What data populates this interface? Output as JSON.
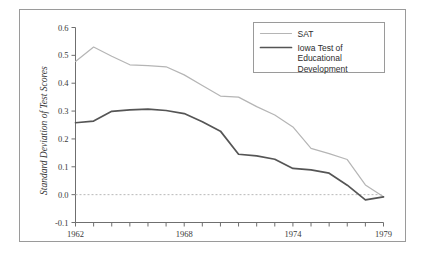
{
  "chart_data": {
    "type": "line",
    "title": "",
    "xlabel": "",
    "ylabel": "Standard Deviation of Test Scores",
    "x": [
      1962,
      1963,
      1964,
      1965,
      1966,
      1967,
      1968,
      1969,
      1970,
      1971,
      1972,
      1973,
      1974,
      1975,
      1976,
      1977,
      1978,
      1979
    ],
    "xlim": [
      1962,
      1979
    ],
    "ylim": [
      -0.1,
      0.6
    ],
    "grid": false,
    "zero_reference_line": 0.0,
    "legend_position": "top-right",
    "xticks": [
      1962,
      1963,
      1964,
      1965,
      1966,
      1967,
      1968,
      1969,
      1970,
      1971,
      1972,
      1973,
      1974,
      1975,
      1976,
      1977,
      1978,
      1979
    ],
    "xtick_labels": [
      "1962",
      "",
      "",
      "",
      "",
      "",
      "1968",
      "",
      "",
      "",
      "",
      "",
      "1974",
      "",
      "",
      "",
      "",
      "1979"
    ],
    "yticks": [
      -0.1,
      0.0,
      0.1,
      0.2,
      0.3,
      0.4,
      0.5,
      0.6
    ],
    "ytick_labels": [
      "-0.1",
      "0.0",
      "0.1",
      "0.2",
      "0.3",
      "0.4",
      "0.5",
      "0.6"
    ],
    "series": [
      {
        "name": "SAT",
        "color": "#b5b5b5",
        "width": 1.2,
        "values": [
          0.478,
          0.53,
          0.497,
          0.466,
          0.463,
          0.459,
          0.43,
          0.392,
          0.354,
          0.35,
          0.316,
          0.286,
          0.243,
          0.166,
          0.147,
          0.126,
          0.035,
          -0.008
        ]
      },
      {
        "name": "Iowa Test of Educational Development",
        "color": "#555555",
        "width": 1.7,
        "values": [
          0.258,
          0.264,
          0.299,
          0.304,
          0.307,
          0.302,
          0.291,
          0.262,
          0.228,
          0.145,
          0.139,
          0.127,
          0.094,
          0.089,
          0.077,
          0.034,
          -0.019,
          -0.008
        ]
      }
    ]
  },
  "legend": {
    "entries": [
      {
        "label": "SAT"
      },
      {
        "label": "Iowa Test of Educational Development"
      }
    ]
  }
}
